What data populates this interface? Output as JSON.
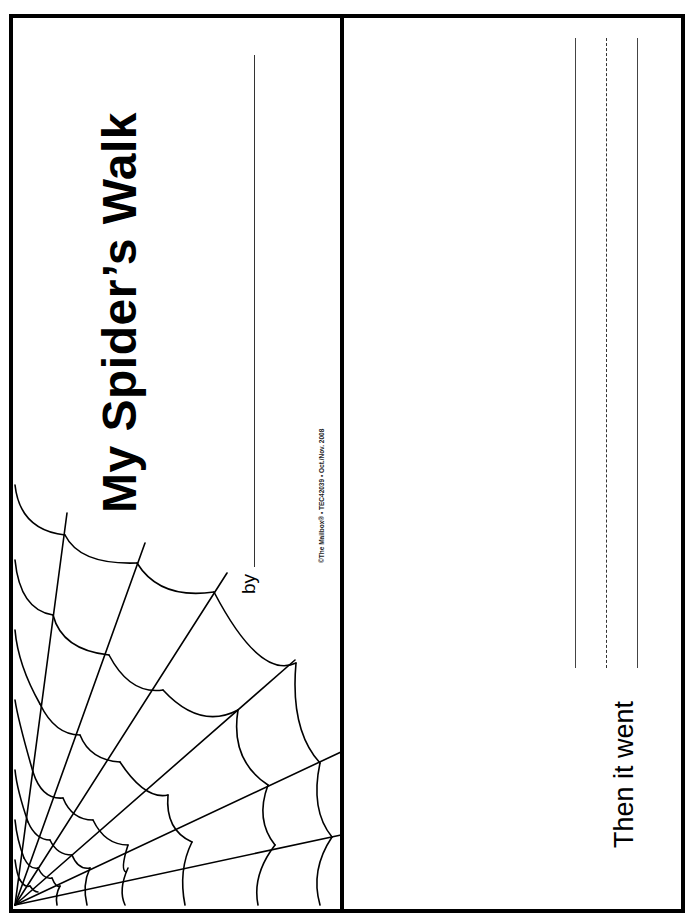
{
  "page": {
    "cover": {
      "title": "My Spider’s Walk",
      "byline_label": "by",
      "copyright": "©The Mailbox® • TEC42039 • Oct./Nov. 2008",
      "illustration": "spider-web"
    },
    "inner_page": {
      "prompt": "Then it went",
      "writing_lines": [
        "solid",
        "dashed",
        "solid"
      ]
    }
  }
}
